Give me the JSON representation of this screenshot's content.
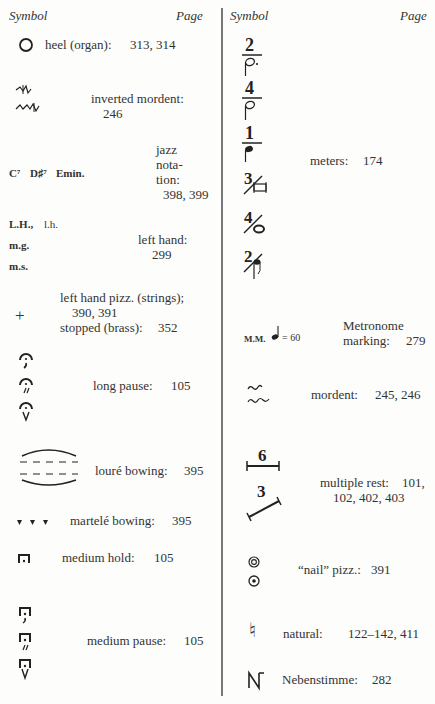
{
  "header": {
    "left": {
      "symbol_label": "Symbol",
      "page_label": "Page"
    },
    "right": {
      "symbol_label": "Symbol",
      "page_label": "Page"
    }
  },
  "left_column": {
    "entries": [
      {
        "symbol": "circle",
        "term": "heel (organ):",
        "pages": "313, 314"
      },
      {
        "symbol": "inverted-mordent",
        "term": "inverted mordent:",
        "pages": "246"
      },
      {
        "symbol_text": [
          "C⁷",
          "D♯⁷",
          "Emin."
        ],
        "term_lines": [
          "jazz",
          "nota-",
          "tion:"
        ],
        "pages": "398, 399"
      },
      {
        "symbol_text": [
          "L.H.,",
          "l.h.",
          "m.g.",
          "m.s."
        ],
        "term": "left hand:",
        "pages": "299"
      },
      {
        "symbol_text": [
          "+"
        ],
        "term": "left hand pizz. (strings);",
        "pages": "390, 391",
        "term2": "stopped (brass):",
        "pages2": "352"
      },
      {
        "symbol": "fermata-variants",
        "term": "long pause:",
        "pages": "105"
      },
      {
        "symbol": "loure-bowing",
        "term": "louré bowing:",
        "pages": "395"
      },
      {
        "symbol": "martele-wedges",
        "term": "martelé bowing:",
        "pages": "395"
      },
      {
        "symbol": "square-fermata",
        "term": "medium hold:",
        "pages": "105"
      },
      {
        "symbol": "square-fermata-variants",
        "term": "medium pause:",
        "pages": "105"
      }
    ]
  },
  "right_column": {
    "entries": [
      {
        "symbol": "meter-variants",
        "fractions": [
          "2",
          "4",
          "1",
          "3",
          "4",
          "2"
        ],
        "term": "meters:",
        "pages": "174"
      },
      {
        "symbol_text": [
          "M.M.",
          "= 60"
        ],
        "term_lines": [
          "Metronome",
          "marking:"
        ],
        "pages": "279"
      },
      {
        "symbol": "mordent",
        "term": "mordent:",
        "pages": "245, 246"
      },
      {
        "symbol": "multiple-rest",
        "numbers": [
          "6",
          "3"
        ],
        "term": "multiple rest:",
        "pages": "101,",
        "pages_line2": "102, 402, 403"
      },
      {
        "symbol": "nail-pizz",
        "term": "“nail” pizz.:",
        "pages": "391"
      },
      {
        "symbol_text": [
          "♮"
        ],
        "term": "natural:",
        "pages": "122–142, 411"
      },
      {
        "symbol_text": [
          "N"
        ],
        "term": "Nebenstimme:",
        "pages": "282"
      }
    ]
  }
}
